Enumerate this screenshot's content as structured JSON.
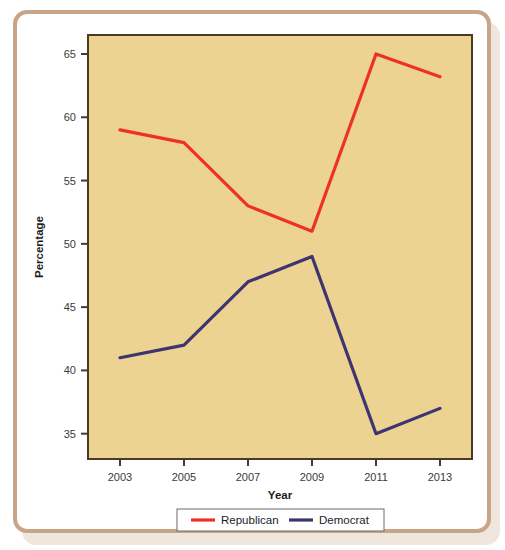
{
  "figure": {
    "frame_color": "#c8a488",
    "card_background": "#ffffff"
  },
  "chart_data": {
    "type": "line",
    "title": "",
    "subtitle": "",
    "xlabel": "Year",
    "ylabel": "Percentage",
    "categories": [
      "2003",
      "2005",
      "2007",
      "2009",
      "2011",
      "2013"
    ],
    "x": [
      2003,
      2005,
      2007,
      2009,
      2011,
      2013
    ],
    "xlim": [
      2002,
      2014
    ],
    "ylim": [
      33,
      66.5
    ],
    "yticks": [
      35,
      40,
      45,
      50,
      55,
      60,
      65
    ],
    "ytick_labels": [
      "35",
      "40",
      "45",
      "50",
      "55",
      "60",
      "65"
    ],
    "xticks": [
      2003,
      2005,
      2007,
      2009,
      2011,
      2013
    ],
    "xtick_labels": [
      "2003",
      "2005",
      "2007",
      "2009",
      "2011",
      "2013"
    ],
    "grid": false,
    "legend_position": "bottom",
    "plot_background": "#ecd392",
    "plot_border_color": "#4a3a28",
    "series": [
      {
        "name": "Republican",
        "color": "#ee3124",
        "values": [
          59,
          58,
          53,
          51,
          65,
          63.2
        ]
      },
      {
        "name": "Democrat",
        "color": "#3d3470",
        "values": [
          41,
          42,
          47,
          49,
          35,
          37
        ]
      }
    ]
  },
  "legend": {
    "entries": [
      {
        "label": "Republican",
        "color": "#ee3124"
      },
      {
        "label": "Democrat",
        "color": "#3d3470"
      }
    ]
  }
}
